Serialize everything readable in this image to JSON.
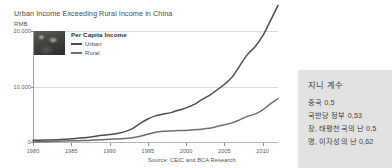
{
  "top_sliver": {
    "ghost_text": "——   ———   —  ——"
  },
  "figure": {
    "title": "Urban Income Exceeding Rural Income in China",
    "y_axis_unit": "RMB",
    "source": "Source: CEIC and BCA Research",
    "legend": {
      "heading": "Per Capita Income",
      "thumbnail_name": "photo-thumbnail",
      "entries": [
        {
          "label": "Urban",
          "color": "#4d4d4d"
        },
        {
          "label": "Rural",
          "color": "#6e6e6e"
        }
      ]
    }
  },
  "chart_data": {
    "type": "line",
    "title": "Urban Income Exceeding Rural Income in China",
    "xlabel": "",
    "ylabel": "RMB",
    "xlim": [
      1980,
      2012
    ],
    "ylim": [
      0,
      20000
    ],
    "ytick_labels": [
      "0",
      "10,000",
      "20,000"
    ],
    "ytick_values": [
      0,
      10000,
      20000
    ],
    "xtick_labels": [
      "1980",
      "1985",
      "1990",
      "1995",
      "2000",
      "2005",
      "2010"
    ],
    "xtick_values": [
      1980,
      1985,
      1990,
      1995,
      2000,
      2005,
      2010
    ],
    "grid": true,
    "legend_position": "top-left",
    "annotations": [
      "Source: CEIC and BCA Research"
    ],
    "x": [
      1980,
      1981,
      1982,
      1983,
      1984,
      1985,
      1986,
      1987,
      1988,
      1989,
      1990,
      1991,
      1992,
      1993,
      1994,
      1995,
      1996,
      1997,
      1998,
      1999,
      2000,
      2001,
      2002,
      2003,
      2004,
      2005,
      2006,
      2007,
      2008,
      2009,
      2010,
      2011,
      2012
    ],
    "series": [
      {
        "name": "Urban",
        "color": "#4d4d4d",
        "values": [
          478,
          500,
          535,
          565,
          660,
          739,
          900,
          1002,
          1181,
          1376,
          1510,
          1700,
          2027,
          2577,
          3496,
          4283,
          4839,
          5160,
          5425,
          5854,
          6280,
          6860,
          7703,
          8472,
          9422,
          10493,
          11760,
          13786,
          15781,
          17175,
          19109,
          21810,
          24565
        ]
      },
      {
        "name": "Rural",
        "color": "#6e6e6e",
        "values": [
          191,
          223,
          270,
          310,
          355,
          398,
          424,
          463,
          545,
          602,
          686,
          709,
          784,
          922,
          1221,
          1578,
          1926,
          2090,
          2162,
          2210,
          2253,
          2366,
          2476,
          2622,
          2936,
          3255,
          3587,
          4140,
          4761,
          5153,
          5919,
          6977,
          7917
        ]
      }
    ]
  },
  "gini_panel": {
    "title": "지니 계수",
    "rows": [
      "중국 0,5",
      "국반당 정부 0,53",
      "장, 태평천국의 난 0,5",
      "명, 이자성의 난 0,62"
    ]
  }
}
